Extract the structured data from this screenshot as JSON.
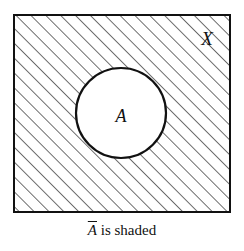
{
  "diagram": {
    "type": "venn-complement",
    "universe_label": "X",
    "set_label": "A",
    "caption": {
      "set": "A",
      "text": " is shaded"
    },
    "colors": {
      "stroke": "#111111",
      "background": "#ffffff"
    }
  }
}
